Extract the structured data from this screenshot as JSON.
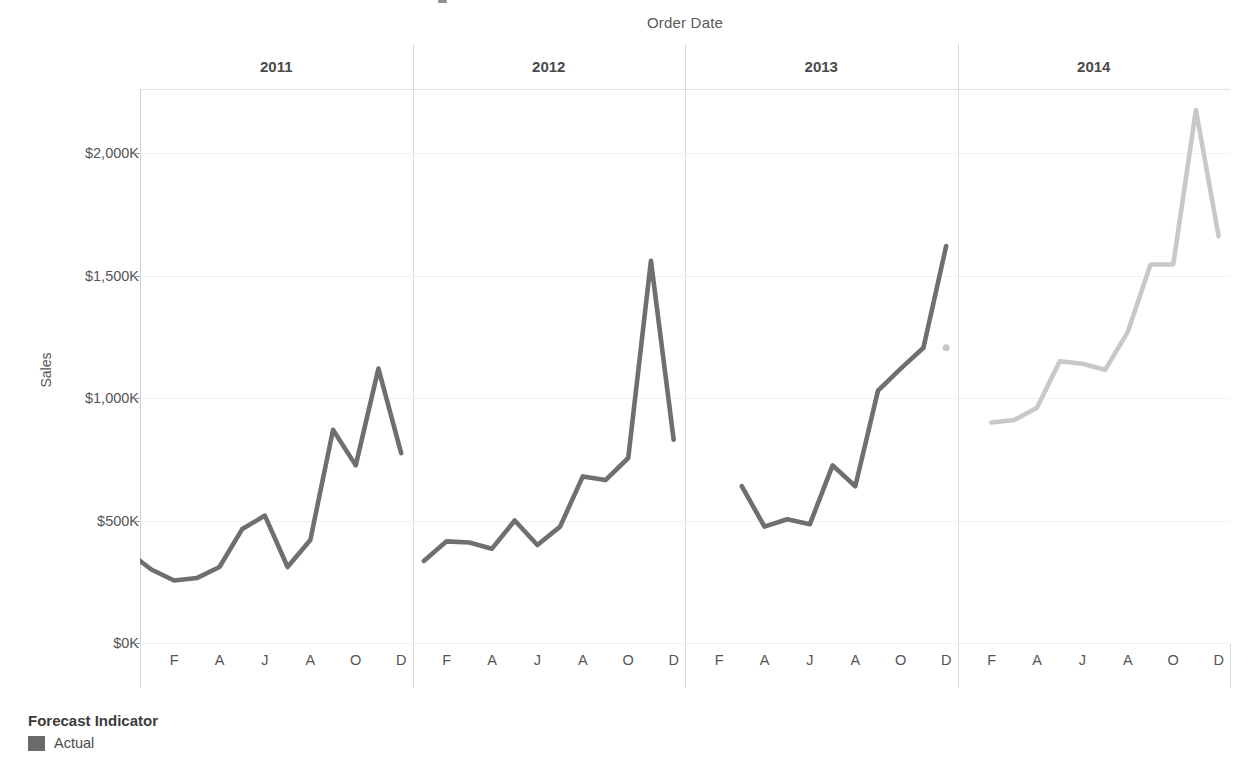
{
  "chart_data": {
    "type": "line",
    "title": "",
    "xlabel": "Order Date",
    "ylabel": "Sales",
    "ylim": [
      0,
      2250
    ],
    "yticks": [
      0,
      500,
      1000,
      1500,
      2000
    ],
    "ytick_labels": [
      "$0K",
      "$500K",
      "$1,000K",
      "$1,500K",
      "$2,000K"
    ],
    "xtick_labels": [
      "F",
      "A",
      "J",
      "A",
      "O",
      "D"
    ],
    "grid": true,
    "legend_position": "bottom-left",
    "units": "thousands of dollars",
    "panels": [
      "2011",
      "2012",
      "2013",
      "2014"
    ],
    "months": [
      "J",
      "F",
      "M",
      "A",
      "M",
      "J",
      "J",
      "A",
      "S",
      "O",
      "N",
      "D"
    ],
    "series": [
      {
        "name": "Actual",
        "panel": "2011",
        "color": "#6f6f6f",
        "values": [
          370,
          300,
          255,
          265,
          310,
          465,
          520,
          310,
          420,
          870,
          725,
          1120,
          775
        ]
      },
      {
        "name": "Actual",
        "panel": "2012",
        "color": "#6f6f6f",
        "values": [
          335,
          415,
          410,
          385,
          500,
          400,
          475,
          680,
          665,
          755,
          1560,
          830
        ]
      },
      {
        "name": "Actual",
        "panel": "2013",
        "color": "#6f6f6f",
        "values": [
          640,
          475,
          505,
          485,
          725,
          640,
          1030,
          1120,
          1205,
          1620
        ]
      },
      {
        "name": "Forecast",
        "panel": "2013",
        "color": "#c8c8c8",
        "point_values": [
          1205
        ]
      },
      {
        "name": "Forecast",
        "panel": "2014",
        "color": "#c8c8c8",
        "values": [
          900,
          910,
          960,
          1150,
          1140,
          1115,
          1270,
          1545,
          1545,
          2175,
          1660
        ]
      }
    ]
  },
  "axes": {
    "x_title": "Order Date",
    "y_title": "Sales",
    "y_ticks": [
      {
        "label": "$2,000K",
        "value": 2000
      },
      {
        "label": "$1,500K",
        "value": 1500
      },
      {
        "label": "$1,000K",
        "value": 1000
      },
      {
        "label": "$500K",
        "value": 500
      },
      {
        "label": "$0K",
        "value": 0
      }
    ],
    "x_ticks": [
      "F",
      "A",
      "J",
      "A",
      "O",
      "D"
    ]
  },
  "panels": [
    {
      "label": "2011"
    },
    {
      "label": "2012"
    },
    {
      "label": "2013"
    },
    {
      "label": "2014"
    }
  ],
  "legend": {
    "title": "Forecast Indicator",
    "items": [
      {
        "label": "Actual",
        "color": "#6a6a6a"
      }
    ]
  }
}
